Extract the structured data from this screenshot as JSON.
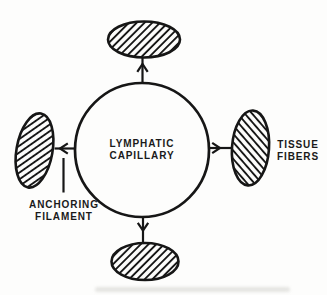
{
  "colors": {
    "ink": "#161616",
    "paper": "#fdfdfc"
  },
  "diagram": {
    "capillary": {
      "lines": [
        "LYMPHATIC",
        "CAPILLARY"
      ]
    },
    "anchoring_filament": {
      "lines": [
        "ANCHORING",
        "FILAMENT"
      ]
    },
    "tissue_fibers": {
      "lines": [
        "TISSUE",
        "FIBERS"
      ]
    }
  }
}
